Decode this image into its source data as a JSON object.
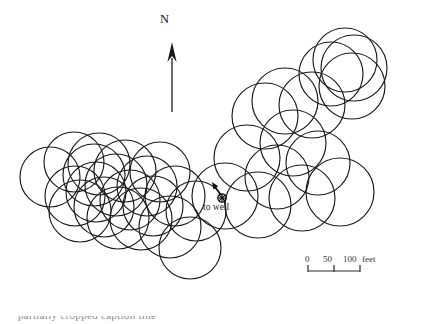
{
  "figure": {
    "type": "map",
    "background_color": "#ffffff",
    "line_color": "#1a1a1a",
    "width": 424,
    "height": 324
  },
  "north_arrow": {
    "label": "N",
    "tip_x": 172,
    "tip_y": 42,
    "tail_x": 172,
    "tail_y": 112
  },
  "well_marker": {
    "label": "to well",
    "symbol": "circle-with-cross",
    "symbol_x": 222,
    "symbol_y": 198,
    "symbol_radius": 4.2,
    "arrow_tip_x": 212,
    "arrow_tip_y": 182,
    "arrow_tail_x": 220,
    "arrow_tail_y": 194
  },
  "scale_bar": {
    "ticks": [
      "0",
      "50",
      "100"
    ],
    "unit": "feet",
    "start_x": 308,
    "end_x": 360,
    "baseline_y": 271,
    "tick_height": 6
  },
  "caption": {
    "text": "partially cropped caption line"
  },
  "chart_data": {
    "type": "scatter",
    "title": "",
    "xlabel": "",
    "ylabel": "",
    "scale_bar_feet_per_unit": 100,
    "units": "feet",
    "circles": [
      {
        "cx": 50,
        "cy": 177,
        "r": 30
      },
      {
        "cx": 74,
        "cy": 162,
        "r": 30
      },
      {
        "cx": 75,
        "cy": 196,
        "r": 30
      },
      {
        "cx": 80,
        "cy": 211,
        "r": 31
      },
      {
        "cx": 94,
        "cy": 175,
        "r": 31
      },
      {
        "cx": 96,
        "cy": 192,
        "r": 30
      },
      {
        "cx": 99,
        "cy": 164,
        "r": 31
      },
      {
        "cx": 104,
        "cy": 207,
        "r": 30
      },
      {
        "cx": 116,
        "cy": 185,
        "r": 31
      },
      {
        "cx": 118,
        "cy": 218,
        "r": 31
      },
      {
        "cx": 125,
        "cy": 171,
        "r": 31
      },
      {
        "cx": 130,
        "cy": 200,
        "r": 30
      },
      {
        "cx": 141,
        "cy": 219,
        "r": 31
      },
      {
        "cx": 147,
        "cy": 186,
        "r": 30
      },
      {
        "cx": 153,
        "cy": 206,
        "r": 30
      },
      {
        "cx": 160,
        "cy": 172,
        "r": 30
      },
      {
        "cx": 170,
        "cy": 227,
        "r": 31
      },
      {
        "cx": 175,
        "cy": 196,
        "r": 30
      },
      {
        "cx": 190,
        "cy": 248,
        "r": 31
      },
      {
        "cx": 196,
        "cy": 211,
        "r": 30
      },
      {
        "cx": 225,
        "cy": 196,
        "r": 33
      },
      {
        "cx": 247,
        "cy": 158,
        "r": 33
      },
      {
        "cx": 258,
        "cy": 205,
        "r": 33
      },
      {
        "cx": 265,
        "cy": 116,
        "r": 33
      },
      {
        "cx": 277,
        "cy": 177,
        "r": 32
      },
      {
        "cx": 285,
        "cy": 101,
        "r": 33
      },
      {
        "cx": 293,
        "cy": 143,
        "r": 33
      },
      {
        "cx": 302,
        "cy": 198,
        "r": 33
      },
      {
        "cx": 312,
        "cy": 105,
        "r": 33
      },
      {
        "cx": 318,
        "cy": 163,
        "r": 32
      },
      {
        "cx": 331,
        "cy": 74,
        "r": 32
      },
      {
        "cx": 340,
        "cy": 192,
        "r": 34
      },
      {
        "cx": 345,
        "cy": 60,
        "r": 32
      },
      {
        "cx": 352,
        "cy": 86,
        "r": 33
      },
      {
        "cx": 354,
        "cy": 68,
        "r": 33
      }
    ]
  }
}
